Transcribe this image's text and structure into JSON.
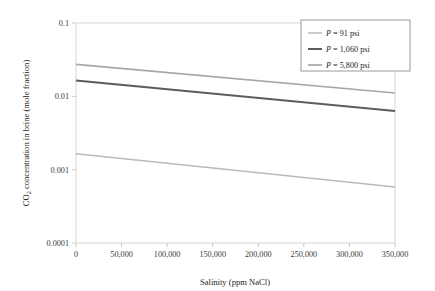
{
  "chart_data": {
    "type": "line",
    "title": "",
    "xlabel": "Salinity (ppm NaCl)",
    "ylabel": "CO2 concentration in brine (mole fraction)",
    "ylabel_parts": {
      "pre": "CO",
      "sub": "2",
      "post": " concentration in brine (mole fraction)"
    },
    "xlim": [
      0,
      350000
    ],
    "ylim": [
      0.0001,
      0.1
    ],
    "yscale": "log",
    "xscale": "linear",
    "grid": false,
    "legend_position": "top-right",
    "xticks": [
      0,
      50000,
      100000,
      150000,
      200000,
      250000,
      300000,
      350000
    ],
    "xtick_labels": [
      "0",
      "50,000",
      "100,000",
      "150,000",
      "200,000",
      "250,000",
      "300,000",
      "350,000"
    ],
    "yticks": [
      0.0001,
      0.001,
      0.01,
      0.1
    ],
    "ytick_labels": [
      "0.0001",
      "0.001",
      "0.01",
      "0.1"
    ],
    "series": [
      {
        "name": "P = 91 psi",
        "label_pre": "P",
        "label_post": " = 91 psi",
        "color": "#b9b9b9",
        "width": 1.5,
        "x": [
          0,
          350000
        ],
        "values": [
          0.00165,
          0.00058
        ]
      },
      {
        "name": "P = 1,060 psi",
        "label_pre": "P",
        "label_post": " = 1,060 psi",
        "color": "#5d5d5d",
        "width": 2.0,
        "x": [
          0,
          350000
        ],
        "values": [
          0.0165,
          0.0063
        ]
      },
      {
        "name": "P = 5,800 psi",
        "label_pre": "P",
        "label_post": " = 5,800 psi",
        "color": "#a6a6a6",
        "width": 1.7,
        "x": [
          0,
          350000
        ],
        "values": [
          0.0272,
          0.0111
        ]
      }
    ]
  },
  "axes": {
    "frame_color": "#d6d6d6",
    "tick_color": "#c9c9c9"
  },
  "legend": {
    "border_color": "#9a9a9a",
    "background": "#ffffff"
  }
}
